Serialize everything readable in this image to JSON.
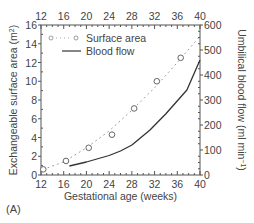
{
  "panel_label": "(A)",
  "chart_data": {
    "type": "line",
    "title": "",
    "xlabel": "Gestational age (weeks)",
    "ylabel": "Exchangeable surface area (m2)",
    "ylabel_right": "Umbilical blood flow (ml min-1)",
    "xlim": [
      12,
      40
    ],
    "ylim": [
      0,
      16
    ],
    "ylim_right": [
      0,
      600
    ],
    "x_ticks": [
      12,
      16,
      20,
      24,
      28,
      32,
      36,
      40
    ],
    "y_ticks": [
      0,
      2,
      4,
      6,
      8,
      10,
      12,
      14,
      16
    ],
    "y_ticks_right": [
      0,
      100,
      200,
      300,
      400,
      500,
      600
    ],
    "grid": false,
    "legend_position": "upper-left",
    "series": [
      {
        "name": "Surface area",
        "style": "circles-with-dotted-line",
        "axis": "left",
        "points": [
          {
            "x": 12.4,
            "y": 0.6
          },
          {
            "x": 16.4,
            "y": 1.5
          },
          {
            "x": 20.4,
            "y": 2.9
          },
          {
            "x": 24.5,
            "y": 4.3
          },
          {
            "x": 28.4,
            "y": 7.1
          },
          {
            "x": 32.4,
            "y": 10.0
          },
          {
            "x": 36.6,
            "y": 12.5
          }
        ],
        "fit_line": [
          {
            "x": 12.4,
            "y": 0.6
          },
          {
            "x": 16,
            "y": 1.4
          },
          {
            "x": 20,
            "y": 2.9
          },
          {
            "x": 24,
            "y": 4.7
          },
          {
            "x": 28,
            "y": 6.9
          },
          {
            "x": 32,
            "y": 9.3
          },
          {
            "x": 36,
            "y": 12.0
          },
          {
            "x": 39.7,
            "y": 14.6
          }
        ]
      },
      {
        "name": "Blood flow",
        "style": "solid-line",
        "axis": "right",
        "points": [
          {
            "x": 17.0,
            "y": 36
          },
          {
            "x": 20,
            "y": 52
          },
          {
            "x": 24,
            "y": 78
          },
          {
            "x": 26,
            "y": 96
          },
          {
            "x": 28,
            "y": 120
          },
          {
            "x": 31.2,
            "y": 180
          },
          {
            "x": 34,
            "y": 245
          },
          {
            "x": 37.7,
            "y": 340
          },
          {
            "x": 40,
            "y": 460
          }
        ]
      }
    ]
  }
}
